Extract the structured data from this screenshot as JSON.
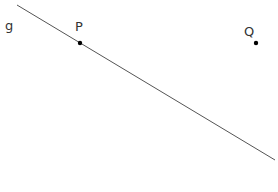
{
  "diagram": {
    "line": {
      "name": "g",
      "label": "g",
      "color": "#555555"
    },
    "points": [
      {
        "name": "P",
        "label": "P",
        "color": "#000000",
        "on_line": true
      },
      {
        "name": "Q",
        "label": "Q",
        "color": "#000000",
        "on_line": false
      }
    ]
  }
}
